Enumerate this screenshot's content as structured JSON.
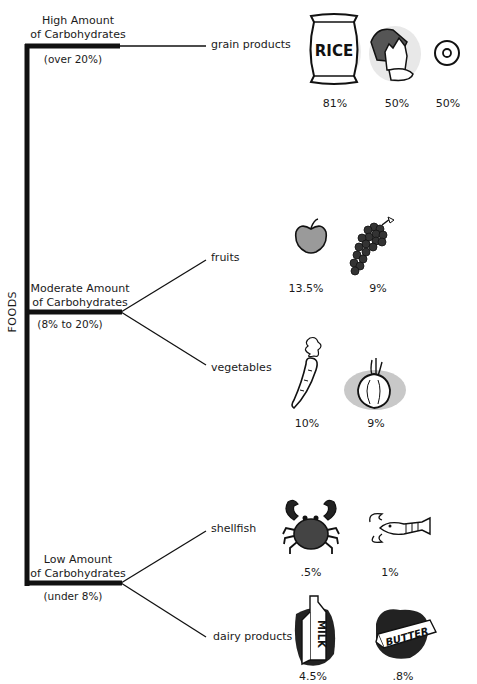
{
  "diagram": {
    "root_label": "FOODS",
    "categories": [
      {
        "title_line1": "High Amount",
        "title_line2": "of Carbohydrates",
        "range": "(over 20%)",
        "groups": [
          {
            "label": "grain products",
            "items": [
              {
                "icon": "rice-bag-icon",
                "icon_text": "RICE",
                "percent": "81%"
              },
              {
                "icon": "bread-icon",
                "percent": "50%"
              },
              {
                "icon": "cereal-ring-icon",
                "percent": "50%"
              }
            ]
          }
        ]
      },
      {
        "title_line1": "Moderate Amount",
        "title_line2": "of Carbohydrates",
        "range": "(8% to 20%)",
        "groups": [
          {
            "label": "fruits",
            "items": [
              {
                "icon": "apple-icon",
                "percent": "13.5%"
              },
              {
                "icon": "grapes-icon",
                "percent": "9%"
              }
            ]
          },
          {
            "label": "vegetables",
            "items": [
              {
                "icon": "carrot-icon",
                "percent": "10%"
              },
              {
                "icon": "onion-icon",
                "percent": "9%"
              }
            ]
          }
        ]
      },
      {
        "title_line1": "Low Amount",
        "title_line2": "of Carbohydrates",
        "range": "(under 8%)",
        "groups": [
          {
            "label": "shellfish",
            "items": [
              {
                "icon": "crab-icon",
                "percent": ".5%"
              },
              {
                "icon": "lobster-icon",
                "percent": "1%"
              }
            ]
          },
          {
            "label": "dairy products",
            "items": [
              {
                "icon": "milk-carton-icon",
                "icon_text": "MILK",
                "percent": "4.5%"
              },
              {
                "icon": "butter-icon",
                "icon_text": "BUTTER",
                "percent": ".8%"
              }
            ]
          }
        ]
      }
    ]
  }
}
